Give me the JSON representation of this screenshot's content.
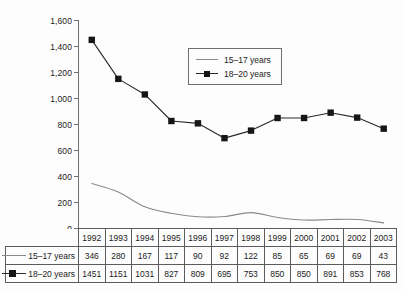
{
  "chart_data": {
    "type": "line",
    "title": "",
    "xlabel": "",
    "ylabel": "",
    "categories": [
      "1992",
      "1993",
      "1994",
      "1995",
      "1996",
      "1997",
      "1998",
      "1999",
      "2000",
      "2001",
      "2002",
      "2003"
    ],
    "series": [
      {
        "name": "15–17 years",
        "values": [
          346,
          280,
          167,
          117,
          90,
          92,
          122,
          85,
          65,
          69,
          69,
          43
        ],
        "marker": "none",
        "color": "#8a8a8a"
      },
      {
        "name": "18–20 years",
        "values": [
          1451,
          1151,
          1031,
          827,
          809,
          695,
          753,
          850,
          850,
          891,
          853,
          768
        ],
        "marker": "square",
        "color": "#2a2a2a"
      }
    ],
    "ylim": [
      0,
      1600
    ],
    "yticks": [
      0,
      200,
      400,
      600,
      800,
      1000,
      1200,
      1400,
      1600
    ],
    "ytick_labels": [
      "0",
      "200",
      "400",
      "600",
      "800",
      "1,000",
      "1,200",
      "1,400",
      "1,600"
    ],
    "grid": false,
    "legend_position": "upper-center"
  },
  "legend": {
    "entries": [
      {
        "label": "15–17 years",
        "key": "line-key"
      },
      {
        "label": "18–20 years",
        "key": "line-square-marker-key"
      }
    ]
  },
  "table": {
    "header": [
      "1992",
      "1993",
      "1994",
      "1995",
      "1996",
      "1997",
      "1998",
      "1999",
      "2000",
      "2001",
      "2002",
      "2003"
    ],
    "rows": [
      {
        "label": "15–17 years",
        "values": [
          "346",
          "280",
          "167",
          "117",
          "90",
          "92",
          "122",
          "85",
          "65",
          "69",
          "69",
          "43"
        ]
      },
      {
        "label": "18–20 years",
        "values": [
          "1451",
          "1151",
          "1031",
          "827",
          "809",
          "695",
          "753",
          "850",
          "850",
          "891",
          "853",
          "768"
        ]
      }
    ]
  },
  "colors": {
    "background": "#fdfdfd",
    "axis": "#6f6f6f",
    "series_1": "#8a8a8a",
    "series_2": "#2a2a2a",
    "marker_fill": "#161616",
    "table_border": "#5c5c5c",
    "text": "#1b1b1b"
  }
}
